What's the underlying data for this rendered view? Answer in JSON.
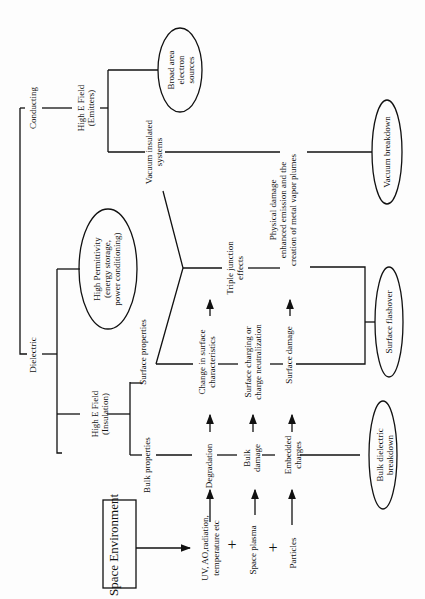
{
  "diagram": {
    "orientation": "rotated-90-ccw",
    "nodes": {
      "space_environment": "Space Environment",
      "uv_line1": "UV, AO,radiation,",
      "uv_line2": "temperature etc",
      "space_plasma": "Space plasma",
      "particles": "Particles",
      "plus1": "+",
      "plus2": "+",
      "degradation": "Degradation",
      "bulk_damage_1": "Bulk",
      "bulk_damage_2": "damage",
      "embedded_1": "Embedded",
      "embedded_2": "charges",
      "bulk_properties": "Bulk properties",
      "surface_properties": "Surface properties",
      "change_surface_1": "Change in surface",
      "change_surface_2": "characteristics",
      "surface_charging_1": "Surface charging or",
      "surface_charging_2": "charge neutralization",
      "surface_damage": "Surface damage",
      "triple_1": "Triple junction",
      "triple_2": "effects",
      "physical_1": "Physical  damage",
      "physical_2": "enhanced emission and the",
      "physical_3": "creation of metal vapor plumes",
      "high_e_insul_1": "High  E Field",
      "high_e_insul_2": "(Insulation)",
      "dielectric": "Dielectric",
      "conducting": "Conducting",
      "high_perm_1": "High Permittivity",
      "high_perm_2": "(energy storage,",
      "high_perm_3": "power conditioning)",
      "high_e_emit_1": "High E Field",
      "high_e_emit_2": "(Emitters)",
      "vacuum_ins_1": "Vacuum insulated",
      "vacuum_ins_2": "systems",
      "broad_1": "Broad area",
      "broad_2": "electron",
      "broad_3": "sources",
      "bulk_breakdown_1": "Bulk dielectric",
      "bulk_breakdown_2": "breakdown",
      "surface_flashover": "Surface flashover",
      "vacuum_breakdown": "Vacuum breakdown"
    }
  }
}
